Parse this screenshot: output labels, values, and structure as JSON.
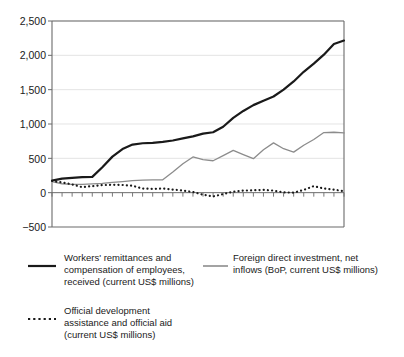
{
  "chart_data": {
    "type": "line",
    "title": "",
    "subtitle": "",
    "xlabel": "",
    "ylabel": "",
    "ylim": [
      -500,
      2500
    ],
    "yticks": [
      -500,
      0,
      500,
      1000,
      1500,
      2000,
      2500
    ],
    "ytick_labels": [
      "−500",
      "0",
      "500",
      "1,000",
      "1,500",
      "2,000",
      "2,500"
    ],
    "grid": "horizontal",
    "xlim": [
      0,
      29
    ],
    "xtick_labels": [],
    "x": [
      0,
      1,
      2,
      3,
      4,
      5,
      6,
      7,
      8,
      9,
      10,
      11,
      12,
      13,
      14,
      15,
      16,
      17,
      18,
      19,
      20,
      21,
      22,
      23,
      24,
      25,
      26,
      27,
      28,
      29
    ],
    "legend_position": "below-plot",
    "series": [
      {
        "name": "Workers' remittances and compensation of employees, received (current US$ millions)",
        "style": "solid",
        "color": "#1a1a1a",
        "width": 2.2,
        "values": [
          175,
          205,
          215,
          225,
          230,
          370,
          525,
          635,
          700,
          720,
          725,
          740,
          760,
          790,
          820,
          860,
          880,
          960,
          1090,
          1190,
          1275,
          1340,
          1400,
          1500,
          1620,
          1760,
          1880,
          2010,
          2165,
          2215
        ]
      },
      {
        "name": "Foreign direct investment, net inflows (BoP, current US$ millions)",
        "style": "solid",
        "color": "#8c8c8c",
        "width": 1.3,
        "values": [
          160,
          130,
          120,
          122,
          128,
          135,
          150,
          162,
          175,
          182,
          186,
          188,
          300,
          420,
          520,
          480,
          465,
          540,
          615,
          555,
          495,
          625,
          725,
          640,
          590,
          690,
          775,
          875,
          880,
          870
        ]
      },
      {
        "name": "Official development assistance and official aid (current US$ millions)",
        "style": "dotted",
        "color": "#1a1a1a",
        "width": 2.2,
        "values": [
          170,
          150,
          120,
          80,
          95,
          110,
          115,
          112,
          100,
          60,
          55,
          60,
          45,
          30,
          10,
          -30,
          -55,
          -20,
          15,
          30,
          35,
          40,
          30,
          5,
          0,
          40,
          95,
          60,
          45,
          20
        ]
      }
    ]
  },
  "y_axis": {
    "labels": [
      "2,500",
      "2,000",
      "1,500",
      "1,000",
      "500",
      "0",
      "−500"
    ]
  },
  "legend": {
    "items": [
      {
        "id": "remittances",
        "swatch": "solid-black-line",
        "lines": [
          "Workers' remittances and",
          "compensation of employees,",
          "received (current US$ millions)"
        ]
      },
      {
        "id": "fdi",
        "swatch": "solid-grey-line",
        "lines": [
          "Foreign direct investment, net",
          "inflows (BoP, current US$ millions)"
        ]
      },
      {
        "id": "oda",
        "swatch": "dotted-black-line",
        "lines": [
          "Official development",
          "assistance and official aid",
          "(current US$ millions)"
        ]
      }
    ]
  },
  "colors": {
    "series_black": "#1a1a1a",
    "series_grey": "#8c8c8c",
    "axis": "#6b6b6b",
    "grid": "#d8d8d8",
    "background": "#ffffff"
  }
}
